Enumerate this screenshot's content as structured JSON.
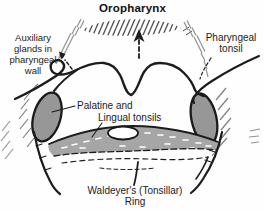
{
  "figure": {
    "title": "Oropharynx",
    "labels": {
      "auxiliary_glands": "Auxiliary\nglands in\npharyngeal\nwall",
      "pharyngeal_tonsil": "Pharyngeal\ntonsil",
      "palatine_line1": "Palatine and",
      "palatine_line2": "Lingual tonsils",
      "waldeyers_ring": "Waldeyer's (Tonsillar)\nRing"
    },
    "icons": {
      "center_arrow": "dashed-up-arrow",
      "left_arrow": "dashed-up-left-arrow"
    },
    "colors": {
      "background": "#fefefe",
      "ink": "#1c1c1c",
      "tonsil_fill": "#979797",
      "band_fill": "#a6a6a6",
      "hatch_dark": "#4d4d4d",
      "hatch_mid": "#7d7d7d",
      "hatch_light": "#949494",
      "stipple": "#ffffff",
      "paper": "#ffffff"
    }
  }
}
